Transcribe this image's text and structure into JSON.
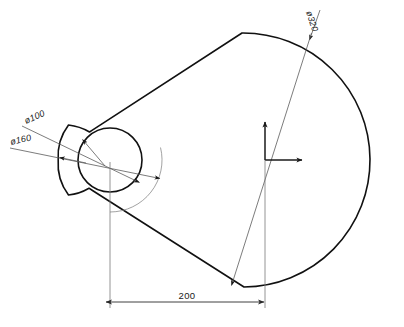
{
  "drawing": {
    "title": "Mechanical Part Outline Drawing",
    "background_color": "#ffffff",
    "line_color": "#111111",
    "thin_line_color": "#8a8a8a",
    "dimension_color": "#2a2a2a"
  },
  "annotations": {
    "bore_diameter": "ø100",
    "boss_diameter": "ø160",
    "body_diameter": "ø320",
    "center_distance": "200"
  },
  "geometry": {
    "bore_center": {
      "x": 110,
      "y": 160
    },
    "bore_radius": 32,
    "boss_radius": 52,
    "origin": {
      "x": 265,
      "y": 160
    },
    "body_radius": 103,
    "dimension_span": {
      "from": 105,
      "to": 265,
      "y": 302
    }
  },
  "axes": {
    "x_axis_label": "X",
    "y_axis_label": "Y",
    "origin_marker": "origin"
  },
  "footer": {
    "caption": ""
  }
}
